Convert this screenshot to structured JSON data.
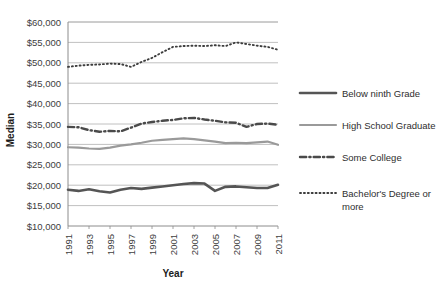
{
  "chart_data": {
    "type": "line",
    "title": "",
    "xlabel": "Year",
    "ylabel": "Median",
    "x": [
      1991,
      1992,
      1993,
      1994,
      1995,
      1996,
      1997,
      1998,
      1999,
      2000,
      2001,
      2002,
      2003,
      2004,
      2005,
      2006,
      2007,
      2008,
      2009,
      2010,
      2011
    ],
    "xtick_labels": [
      "1991",
      "1993",
      "1995",
      "1997",
      "1999",
      "2001",
      "2003",
      "2005",
      "2007",
      "2009",
      "2011"
    ],
    "xtick_values": [
      1991,
      1993,
      1995,
      1997,
      1999,
      2001,
      2003,
      2005,
      2007,
      2009,
      2011
    ],
    "ytick_labels": [
      "$10,000",
      "$15,000",
      "$20,000",
      "$25,000",
      "$30,000",
      "$35,000",
      "$40,000",
      "$45,000",
      "$50,000",
      "$55,000",
      "$60,000"
    ],
    "ytick_values": [
      10000,
      15000,
      20000,
      25000,
      30000,
      35000,
      40000,
      45000,
      50000,
      55000,
      60000
    ],
    "ylim": [
      10000,
      60000
    ],
    "xlim": [
      1991,
      2011
    ],
    "grid": "horizontal",
    "legend_position": "right",
    "series": [
      {
        "name": "Below ninth Grade",
        "style": "solid-thick",
        "color": "#555555",
        "width": 2.6,
        "values": [
          18900,
          18600,
          19000,
          18500,
          18200,
          18900,
          19300,
          19100,
          19400,
          19700,
          20000,
          20300,
          20500,
          20400,
          18600,
          19600,
          19700,
          19500,
          19300,
          19300,
          20100
        ]
      },
      {
        "name": "High School Graduate",
        "style": "solid-light",
        "color": "#9a9a9a",
        "width": 2.2,
        "values": [
          29300,
          29200,
          29000,
          28900,
          29200,
          29700,
          30000,
          30400,
          30900,
          31100,
          31300,
          31500,
          31300,
          31000,
          30700,
          30300,
          30400,
          30300,
          30500,
          30700,
          29900
        ]
      },
      {
        "name": "Some College",
        "style": "dash-dot",
        "color": "#4a4a4a",
        "width": 2.4,
        "values": [
          34300,
          34200,
          33500,
          33100,
          33300,
          33200,
          34100,
          35100,
          35500,
          35800,
          36000,
          36400,
          36500,
          36100,
          35800,
          35400,
          35300,
          34300,
          35000,
          35100,
          34800
        ]
      },
      {
        "name": "Bachelor's Degree or more",
        "style": "dotted",
        "color": "#3d3d3d",
        "width": 1.9,
        "values": [
          49000,
          49300,
          49500,
          49600,
          49800,
          49700,
          49000,
          50200,
          51200,
          52600,
          53900,
          54100,
          54200,
          54100,
          54300,
          54100,
          55000,
          54600,
          54200,
          53900,
          53200
        ]
      }
    ]
  },
  "legend": {
    "items": [
      {
        "label": "Below ninth Grade"
      },
      {
        "label": "High School Graduate"
      },
      {
        "label": "Some College"
      },
      {
        "label": "Bachelor's Degree or more"
      }
    ]
  }
}
